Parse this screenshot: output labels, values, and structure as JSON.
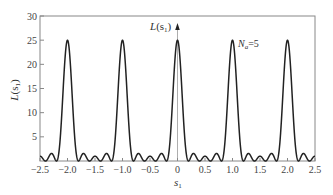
{
  "chart_data": {
    "type": "line",
    "title": "",
    "xlabel": "s1",
    "ylabel": "L(s1)",
    "xlim": [
      -2.5,
      2.5
    ],
    "ylim": [
      0,
      30
    ],
    "grid": false,
    "legend": null,
    "x_ticks": [
      "-2.5",
      "-2.0",
      "-1.5",
      "-1.0",
      "-0.5",
      "0",
      "0.5",
      "1.0",
      "1.5",
      "2.0",
      "2.5"
    ],
    "y_ticks": [
      "5",
      "10",
      "15",
      "20",
      "25",
      "30"
    ],
    "annotations": [
      {
        "text": "L(s1)",
        "x": 0,
        "y": 28,
        "arrow": "up at s1=0"
      },
      {
        "text": "Na=5",
        "x": 0.75,
        "y": 24
      }
    ],
    "function": "L(s1) = sin^2(N*pi*s1) / sin^2(pi*s1), N = 5",
    "parameters": {
      "N": 5
    },
    "series": [
      {
        "name": "L(s1)",
        "color": "#222222",
        "peaks": [
          {
            "x": -2.0,
            "y": 25
          },
          {
            "x": -1.0,
            "y": 25
          },
          {
            "x": 0.0,
            "y": 25
          },
          {
            "x": 1.0,
            "y": 25
          },
          {
            "x": 2.0,
            "y": 25
          }
        ],
        "zeros": [
          -2.4,
          -2.2,
          -1.8,
          -1.6,
          -1.4,
          -1.2,
          -0.8,
          -0.6,
          -0.4,
          -0.2,
          0.2,
          0.4,
          0.6,
          0.8,
          1.2,
          1.4,
          1.6,
          1.8,
          2.2,
          2.4
        ],
        "sidelobe_max": [
          {
            "x": 0.3,
            "y": 1.7
          },
          {
            "x": 0.5,
            "y": 1.0
          },
          {
            "x": 0.7,
            "y": 1.7
          }
        ],
        "sampled": {
          "x": [
            -2.5,
            -2.4,
            -2.3,
            -2.2,
            -2.1,
            -2.0,
            -1.9,
            -1.8,
            -1.7,
            -1.6,
            -1.5,
            -1.4,
            -1.3,
            -1.2,
            -1.1,
            -1.0,
            -0.9,
            -0.8,
            -0.7,
            -0.6,
            -0.5,
            -0.4,
            -0.3,
            -0.2,
            -0.1,
            0.0,
            0.1,
            0.2,
            0.3,
            0.4,
            0.5,
            0.6,
            0.7,
            0.8,
            0.9,
            1.0,
            1.1,
            1.2,
            1.3,
            1.4,
            1.5,
            1.6,
            1.7,
            1.8,
            1.9,
            2.0,
            2.1,
            2.2,
            2.3,
            2.4,
            2.5
          ],
          "y": [
            1.0,
            0,
            1.7,
            0,
            10.5,
            25,
            10.5,
            0,
            1.7,
            0,
            1.0,
            0,
            1.7,
            0,
            10.5,
            25,
            10.5,
            0,
            1.7,
            0,
            1.0,
            0,
            1.7,
            0,
            10.5,
            25,
            10.5,
            0,
            1.7,
            0,
            1.0,
            0,
            1.7,
            0,
            10.5,
            25,
            10.5,
            0,
            1.7,
            0,
            1.0,
            0,
            1.7,
            0,
            10.5,
            25,
            10.5,
            0,
            1.7,
            0,
            1.0
          ]
        }
      }
    ]
  },
  "labels": {
    "y_axis": "L",
    "y_axis_arg": "(s",
    "y_axis_sub": "1",
    "y_axis_close": ")",
    "x_axis": "s",
    "x_axis_sub": "1",
    "curve_label": "L",
    "curve_label_arg": "(s",
    "curve_label_sub": "1",
    "curve_label_close": ")",
    "n_label": "N",
    "n_sub": "a",
    "n_value": "=5"
  }
}
